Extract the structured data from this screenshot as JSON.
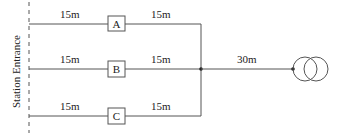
{
  "diagram": {
    "type": "single-line wiring diagram",
    "entrance_label": "Station Entrance",
    "colors": {
      "line": "#555555",
      "text": "#222222",
      "background": "#ffffff"
    },
    "branches": [
      {
        "id": "A",
        "label": "A",
        "left_length": "15m",
        "right_length": "15m"
      },
      {
        "id": "B",
        "label": "B",
        "left_length": "15m",
        "right_length": "15m"
      },
      {
        "id": "C",
        "label": "C",
        "left_length": "15m",
        "right_length": "15m"
      }
    ],
    "feeder": {
      "length": "30m"
    },
    "source": {
      "symbol": "transformer-icon"
    }
  }
}
